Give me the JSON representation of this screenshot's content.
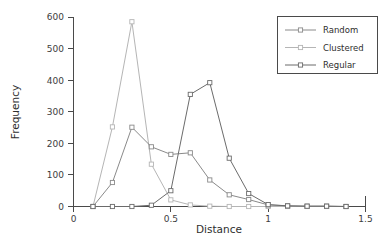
{
  "chart_data": {
    "type": "line",
    "title": "",
    "subtitle": "",
    "xlabel": "Distance",
    "ylabel": "Frequency",
    "xlim": [
      0,
      1.5
    ],
    "ylim": [
      0,
      600
    ],
    "xticks": [
      0,
      0.5,
      1,
      1.5
    ],
    "xticklabels": [
      "0",
      "0.5",
      "1",
      "1.5"
    ],
    "yticks": [
      0,
      100,
      200,
      300,
      400,
      500,
      600
    ],
    "yticklabels": [
      "0",
      "100",
      "200",
      "300",
      "400",
      "500",
      "600"
    ],
    "grid": false,
    "legend_position": "top-right",
    "marker": "open-square",
    "x": [
      0.1,
      0.2,
      0.3,
      0.4,
      0.5,
      0.6,
      0.7,
      0.8,
      0.9,
      1.0,
      1.1,
      1.2,
      1.3,
      1.4
    ],
    "series": [
      {
        "name": "Random",
        "color": "#8a8a8a",
        "values": [
          0,
          76,
          251,
          189,
          165,
          170,
          84,
          37,
          22,
          5,
          2,
          1,
          1,
          0
        ]
      },
      {
        "name": "Clustered",
        "color": "#b5b5b5",
        "values": [
          0,
          252,
          585,
          134,
          21,
          5,
          1,
          0,
          0,
          0,
          0,
          0,
          0,
          0
        ]
      },
      {
        "name": "Regular",
        "color": "#6b6b6b",
        "values": [
          0,
          0,
          0,
          4,
          50,
          355,
          392,
          153,
          41,
          6,
          2,
          1,
          1,
          0
        ]
      }
    ]
  },
  "legend": {
    "entries": [
      {
        "label": "Random"
      },
      {
        "label": "Clustered"
      },
      {
        "label": "Regular"
      }
    ]
  },
  "axes": {
    "x_title": "Distance",
    "y_title": "Frequency"
  }
}
